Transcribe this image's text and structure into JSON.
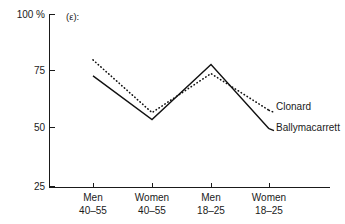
{
  "panel": {
    "label": "(ε):"
  },
  "axes": {
    "y_unit_label": "100 %",
    "y_ticks": [
      "100 %",
      "75",
      "50",
      "25"
    ],
    "y_tick_values": [
      100,
      75,
      50,
      25
    ],
    "x_tick_labels": [
      {
        "line1": "Men",
        "line2": "40–55"
      },
      {
        "line1": "Women",
        "line2": "40–55"
      },
      {
        "line1": "Men",
        "line2": "18–25"
      },
      {
        "line1": "Women",
        "line2": "18–25"
      }
    ]
  },
  "legend": {
    "clonard": "Clonard",
    "ballymacarrett": "Ballymacarrett"
  },
  "colors": {
    "line": "#111111",
    "axis": "#1a1a1a",
    "background": "#ffffff"
  },
  "chart_data": {
    "type": "line",
    "title": "(ε):",
    "xlabel": "",
    "ylabel": "100 %",
    "ylim": [
      25,
      100
    ],
    "yticks": [
      25,
      50,
      75,
      100
    ],
    "grid": false,
    "legend_position": "right-inline",
    "categories": [
      "Men 40–55",
      "Women 40–55",
      "Men 18–25",
      "Women 18–25"
    ],
    "series": [
      {
        "name": "Clonard",
        "style": "dotted",
        "values": [
          80,
          57,
          74,
          58
        ]
      },
      {
        "name": "Ballymacarrett",
        "style": "solid",
        "values": [
          73,
          54,
          78,
          50
        ]
      }
    ]
  }
}
